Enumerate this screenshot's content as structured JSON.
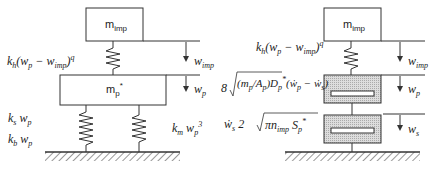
{
  "left_model": {
    "impactor_mass": {
      "base": "m",
      "sub": "imp"
    },
    "plate_mass": {
      "base": "m",
      "sub": "p",
      "sup": "*"
    },
    "contact_force": "k_h(w_p − w_imp)^q",
    "labels": {
      "k_h": "k",
      "k_h_sub": "h",
      "wp_minus": "(w",
      "p": "p",
      "minus_w": " − w",
      "imp": "imp",
      "close_paren": ")",
      "q": "q",
      "ks_wp": "k",
      "s": "s",
      "w": "w",
      "p2": "p",
      "kb_wp": "k",
      "b": "b",
      "km_wp3": "k",
      "m": "m",
      "cube": "3"
    },
    "displacements": [
      {
        "base": "w",
        "sub": "imp"
      },
      {
        "base": "w",
        "sub": "p"
      }
    ]
  },
  "right_model": {
    "impactor_mass": {
      "base": "m",
      "sub": "imp"
    },
    "contact_force": "k_h(w_p − w_imp)^q",
    "damper_top": "8√((m_p/A_p) D_p*)(ẇ_p − ẇ_s)",
    "damper_bottom": "ẇ_s 2√(π n_imp S_p*)",
    "labels": {
      "eight": "8",
      "mp": "m",
      "p": "p",
      "Ap": "A",
      "D": "D",
      "star": "*",
      "wdot_p": "(ẇ",
      "minus": " − ẇ",
      "s": "s",
      "close_paren": ")",
      "wdot_s": "ẇ",
      "two": "2",
      "pi": "π",
      "n": "n",
      "imp": "imp",
      "S": "S"
    },
    "displacements": [
      {
        "base": "w",
        "sub": "imp"
      },
      {
        "base": "w",
        "sub": "p"
      },
      {
        "base": "w",
        "sub": "s"
      }
    ]
  }
}
